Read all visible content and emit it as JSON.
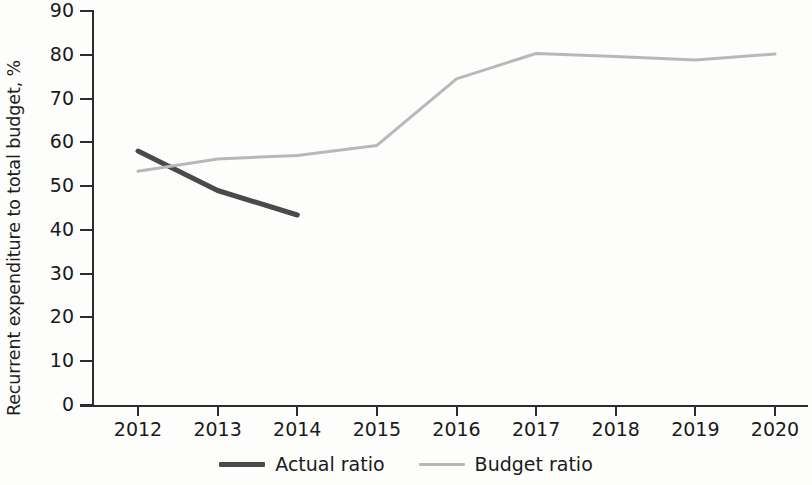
{
  "chart_data": {
    "type": "line",
    "title": "",
    "xlabel": "",
    "ylabel": "Recurrent expenditure to total budget, %",
    "categories": [
      "2012",
      "2013",
      "2014",
      "2015",
      "2016",
      "2017",
      "2018",
      "2019",
      "2020"
    ],
    "x": [
      2012,
      2013,
      2014,
      2015,
      2016,
      2017,
      2018,
      2019,
      2020
    ],
    "xlim": [
      2012,
      2020
    ],
    "ylim": [
      0,
      90
    ],
    "yticks": [
      0,
      10,
      20,
      30,
      40,
      50,
      60,
      70,
      80,
      90
    ],
    "ytick_labels": [
      "0",
      "10",
      "20",
      "30",
      "40",
      "50",
      "60",
      "70",
      "80",
      "90"
    ],
    "grid": false,
    "legend_position": "bottom-center",
    "series": [
      {
        "name": "Actual ratio",
        "color": "#4a4a4a",
        "line_width": 5,
        "x": [
          2012,
          2013,
          2014
        ],
        "values": [
          58.0,
          49.0,
          43.4
        ]
      },
      {
        "name": "Budget ratio",
        "color": "#b8b8b8",
        "line_width": 3,
        "x": [
          2012,
          2013,
          2014,
          2015,
          2016,
          2017,
          2018,
          2019,
          2020
        ],
        "values": [
          53.4,
          56.2,
          57.0,
          59.3,
          74.5,
          80.3,
          79.6,
          78.8,
          80.2
        ]
      }
    ]
  },
  "axis": {
    "y_title": "Recurrent expenditure to total budget, %",
    "y_tick_labels": [
      "90",
      "80",
      "70",
      "60",
      "50",
      "40",
      "30",
      "20",
      "10",
      "0"
    ],
    "x_tick_labels": [
      "2012",
      "2013",
      "2014",
      "2015",
      "2016",
      "2017",
      "2018",
      "2019",
      "2020"
    ]
  },
  "legend": {
    "items": [
      {
        "label": "Actual ratio",
        "color": "#4a4a4a"
      },
      {
        "label": "Budget ratio",
        "color": "#b8b8b8"
      }
    ]
  },
  "colors": {
    "actual": "#4a4a4a",
    "budget": "#b8b8b8",
    "axis": "#2c2c2c",
    "text": "#1a1a1a",
    "background": "#fdfdfc"
  }
}
